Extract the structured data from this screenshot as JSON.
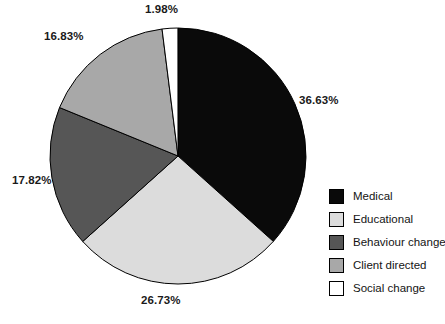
{
  "chart_data": {
    "type": "pie",
    "title": "",
    "subtitle": "",
    "xlabel": "",
    "ylabel": "",
    "legend_position": "right",
    "grid": false,
    "units": "percent",
    "categories": [
      "Medical",
      "Educational",
      "Behaviour change",
      "Client directed",
      "Social change"
    ],
    "values": [
      36.63,
      26.73,
      17.82,
      16.83,
      1.98
    ],
    "data_labels": [
      "36.63%",
      "26.73%",
      "17.82%",
      "16.83%",
      "1.98%"
    ],
    "colors": [
      "#0a0a0a",
      "#dcdcdc",
      "#565656",
      "#a8a8a8",
      "#ffffff"
    ],
    "slices": [
      {
        "label": "Medical",
        "value": 36.63,
        "display": "36.63%",
        "color": "#0a0a0a",
        "start_angle": 0,
        "sweep_angle": 131.868
      },
      {
        "label": "Educational",
        "value": 26.73,
        "display": "26.73%",
        "color": "#dcdcdc",
        "start_angle": 131.868,
        "sweep_angle": 96.228
      },
      {
        "label": "Behaviour change",
        "value": 17.82,
        "display": "17.82%",
        "color": "#565656",
        "start_angle": 228.096,
        "sweep_angle": 64.152
      },
      {
        "label": "Client directed",
        "value": 16.83,
        "display": "16.83%",
        "color": "#a8a8a8",
        "start_angle": 292.248,
        "sweep_angle": 60.588
      },
      {
        "label": "Social change",
        "value": 1.98,
        "display": "1.98%",
        "color": "#ffffff",
        "start_angle": 352.836,
        "sweep_angle": 7.128
      }
    ],
    "geometry": {
      "cx": 178,
      "cy": 156,
      "r": 128,
      "start_at": "12-oclock",
      "direction": "clockwise"
    }
  },
  "labels": {
    "medical_pct": "36.63%",
    "educational_pct": "26.73%",
    "behaviour_pct": "17.82%",
    "client_pct": "16.83%",
    "social_pct": "1.98%"
  },
  "legend": {
    "items": [
      {
        "label": "Medical",
        "color": "#0a0a0a"
      },
      {
        "label": "Educational",
        "color": "#dcdcdc"
      },
      {
        "label": "Behaviour change",
        "color": "#565656"
      },
      {
        "label": "Client directed",
        "color": "#a8a8a8"
      },
      {
        "label": "Social change",
        "color": "#ffffff"
      }
    ]
  }
}
